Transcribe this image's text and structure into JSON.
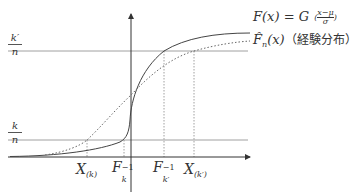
{
  "diagram": {
    "type": "cdf-comparison",
    "y_axis_labels": {
      "upper": {
        "numerator": "k′",
        "denominator": "n"
      },
      "lower": {
        "numerator": "k",
        "denominator": "n"
      }
    },
    "x_axis_labels": [
      {
        "id": "x_k",
        "main": "X",
        "sub": "(k)"
      },
      {
        "id": "f_k_inv",
        "main": "F",
        "sub": "k",
        "sup": "−1"
      },
      {
        "id": "f_kp_inv",
        "main": "F",
        "sub": "k′",
        "sup": "−1"
      },
      {
        "id": "x_kp",
        "main": "X",
        "sub": "(k′)"
      }
    ],
    "legend": {
      "solid": {
        "lhs": "F(x) = G",
        "frac_num": "x−μ",
        "frac_den": "σ"
      },
      "dotted": {
        "lhs": "F̂",
        "sub": "n",
        "arg": "(x)",
        "note": "（経験分布）"
      }
    },
    "colors": {
      "axis": "#333333",
      "solid_curve": "#444444",
      "dotted_curve": "#666666",
      "guide_line": "#888888"
    }
  }
}
